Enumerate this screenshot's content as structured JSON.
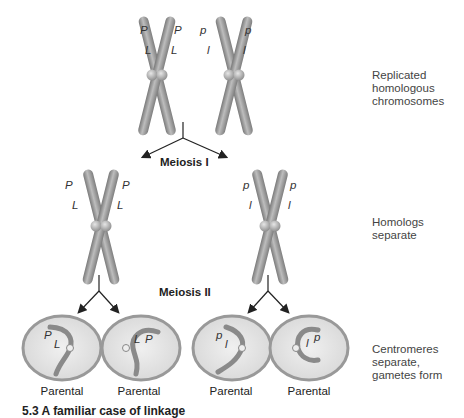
{
  "figure": {
    "stage_labels": {
      "top": "Replicated homologous chromosomes",
      "top_line1": "Replicated",
      "top_line2": "homologous",
      "top_line3": "chromosomes",
      "middle_line1": "Homologs",
      "middle_line2": "separate",
      "bottom_line1": "Centromeres",
      "bottom_line2": "separate,",
      "bottom_line3": "gametes form"
    },
    "steps": {
      "meiosis1": "Meiosis I",
      "meiosis2": "Meiosis II"
    },
    "alleles": {
      "dominant_p": "P",
      "dominant_l": "L",
      "recessive_p": "p",
      "recessive_l": "l"
    },
    "gametes": [
      {
        "label": "Parental",
        "alleles": "P L"
      },
      {
        "label": "Parental",
        "alleles": "L P"
      },
      {
        "label": "Parental",
        "alleles": "p l"
      },
      {
        "label": "Parental",
        "alleles": "l p"
      }
    ],
    "caption": "5.3  A familiar case of linkage"
  },
  "colors": {
    "chromatid": "#8a8a8a",
    "chromatid_light": "#c4c4c4",
    "cell_fill": "#e2e2e2",
    "cell_border": "#9a9a9a",
    "arrow": "#222222"
  }
}
